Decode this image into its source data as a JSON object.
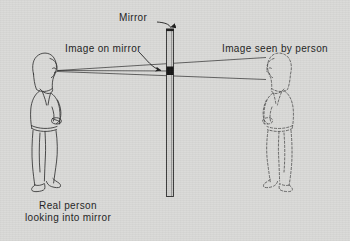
{
  "figure": {
    "domain": "diagram",
    "background_color": "#d9d9d7",
    "ink_color": "#1d1d1d"
  },
  "labels": {
    "mirror": "Mirror",
    "image_on_mirror": "Image on mirror",
    "image_seen_by_person": "Image seen by person",
    "caption_line1": "Real person",
    "caption_line2": "looking into mirror"
  },
  "objects": {
    "real_person": {
      "name": "Real person",
      "style": "solid-outline",
      "facing": "right"
    },
    "virtual_image": {
      "name": "Image seen by person",
      "style": "dashed-outline",
      "facing": "left"
    },
    "mirror": {
      "name": "Mirror",
      "orientation": "vertical",
      "image_patch": "dark segment at eye level"
    }
  },
  "rays": {
    "count": 2,
    "origin": "eye of real person",
    "pass_through": "mirror surface",
    "terminate": "head of virtual image"
  }
}
